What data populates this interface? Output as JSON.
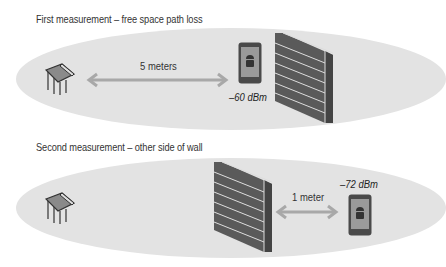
{
  "panels": [
    {
      "caption": "First measurement – free space path loss",
      "distance_label": "5 meters",
      "signal": "–60 dBm",
      "items": [
        "router-icon",
        "arrow",
        "phone-icon",
        "brick-wall-icon"
      ]
    },
    {
      "caption": "Second measurement – other side of wall",
      "distance_label": "1 meter",
      "signal": "–72 dBm",
      "items": [
        "router-icon",
        "brick-wall-icon",
        "arrow",
        "phone-icon"
      ]
    }
  ],
  "colors": {
    "ellipse": "#e3e3e3",
    "arrow": "#a8a8a8",
    "brick": "#5a5a5a",
    "phone_body": "#4a4a4a",
    "phone_screen": "#9a9a9a",
    "text": "#333333"
  }
}
